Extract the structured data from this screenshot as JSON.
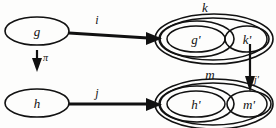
{
  "diagram": {
    "type": "commutative-diagram",
    "background_color": "#fdfdfc",
    "ink_color": "#111111",
    "nodes": [
      {
        "id": "g",
        "label": "g",
        "shape": "ellipse",
        "cx": 37,
        "cy": 31,
        "rx": 32,
        "ry": 14
      },
      {
        "id": "h",
        "label": "h",
        "shape": "ellipse",
        "cx": 37,
        "cy": 103,
        "rx": 32,
        "ry": 14
      },
      {
        "id": "gp",
        "label": "g'",
        "shape": "ellipse",
        "cx": 196,
        "cy": 39,
        "rx": 29,
        "ry": 13
      },
      {
        "id": "kp",
        "label": "k'",
        "shape": "ellipse",
        "cx": 247,
        "cy": 39,
        "rx": 22,
        "ry": 13
      },
      {
        "id": "hp",
        "label": "h'",
        "shape": "ellipse",
        "cx": 196,
        "cy": 104,
        "rx": 29,
        "ry": 13
      },
      {
        "id": "mp",
        "label": "m'",
        "shape": "ellipse",
        "cx": 249,
        "cy": 104,
        "rx": 22,
        "ry": 13
      }
    ],
    "containers": [
      {
        "id": "k",
        "label": "k",
        "cx": 214,
        "cy": 39,
        "rx": 59,
        "ry": 25,
        "label_x": 205,
        "label_y": 12
      },
      {
        "id": "m",
        "label": "m",
        "cx": 214,
        "cy": 104,
        "rx": 59,
        "ry": 25,
        "label_x": 210,
        "label_y": 79
      }
    ],
    "edges": [
      {
        "id": "i",
        "label": "i",
        "from": "g",
        "to": "k",
        "orientation": "horizontal",
        "label_x": 97,
        "label_y": 24
      },
      {
        "id": "j",
        "label": "j",
        "from": "h",
        "to": "m",
        "orientation": "horizontal",
        "label_x": 97,
        "label_y": 97
      },
      {
        "id": "pi",
        "label": "π",
        "from": "g",
        "to": "h",
        "orientation": "vertical",
        "label_x": 43,
        "label_y": 61
      },
      {
        "id": "jprime",
        "label": "j'",
        "from": "kp",
        "to": "mp",
        "orientation": "vertical",
        "label_x": 253,
        "label_y": 82
      }
    ]
  }
}
